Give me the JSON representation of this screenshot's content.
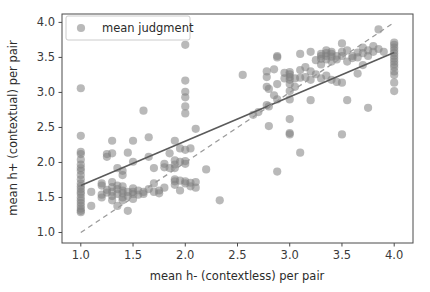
{
  "chart_data": {
    "type": "scatter",
    "title": "",
    "xlabel": "mean h- (contextless) per pair",
    "ylabel": "mean h+ (contextual) per pair",
    "xlim": [
      0.82,
      4.18
    ],
    "ylim": [
      0.85,
      4.12
    ],
    "xticks": [
      1.0,
      1.5,
      2.0,
      2.5,
      3.0,
      3.5,
      4.0
    ],
    "xticklabels": [
      "1.0",
      "1.5",
      "2.0",
      "2.5",
      "3.0",
      "3.5",
      "4.0"
    ],
    "yticks": [
      1.0,
      1.5,
      2.0,
      2.5,
      3.0,
      3.5,
      4.0
    ],
    "yticklabels": [
      "1.0",
      "1.5",
      "2.0",
      "2.5",
      "3.0",
      "3.5",
      "4.0"
    ],
    "grid": false,
    "legend": {
      "position": "upper left",
      "entries": [
        {
          "label": "mean judgment",
          "marker": "circle",
          "color": "#8c8c8c"
        }
      ]
    },
    "marker": {
      "color": "#7f7f7f",
      "opacity": 0.55,
      "radius": 4.1
    },
    "lines": [
      {
        "name": "regression-line",
        "style": "solid",
        "color": "#5a5a5a",
        "width": 1.6,
        "x": [
          1.0,
          4.0
        ],
        "y": [
          1.67,
          3.57
        ]
      },
      {
        "name": "identity-line",
        "style": "dashed",
        "color": "#9a9a9a",
        "width": 1.3,
        "x": [
          1.0,
          4.0
        ],
        "y": [
          1.0,
          4.0
        ]
      }
    ],
    "series": [
      {
        "name": "mean judgment",
        "points": [
          [
            1.0,
            3.06
          ],
          [
            1.0,
            2.38
          ],
          [
            1.0,
            2.15
          ],
          [
            1.0,
            2.12
          ],
          [
            1.0,
            2.04
          ],
          [
            1.0,
            1.97
          ],
          [
            1.0,
            1.92
          ],
          [
            1.0,
            1.88
          ],
          [
            1.0,
            1.82
          ],
          [
            1.0,
            1.76
          ],
          [
            1.0,
            1.7
          ],
          [
            1.0,
            1.66
          ],
          [
            1.0,
            1.62
          ],
          [
            1.0,
            1.58
          ],
          [
            1.0,
            1.55
          ],
          [
            1.0,
            1.5
          ],
          [
            1.0,
            1.46
          ],
          [
            1.0,
            1.42
          ],
          [
            1.0,
            1.38
          ],
          [
            1.0,
            1.34
          ],
          [
            1.0,
            1.31
          ],
          [
            1.0,
            1.29
          ],
          [
            1.1,
            1.58
          ],
          [
            1.1,
            1.38
          ],
          [
            1.2,
            1.7
          ],
          [
            1.2,
            1.67
          ],
          [
            1.2,
            1.54
          ],
          [
            1.2,
            1.5
          ],
          [
            1.25,
            2.12
          ],
          [
            1.25,
            2.08
          ],
          [
            1.25,
            1.61
          ],
          [
            1.25,
            1.57
          ],
          [
            1.3,
            2.31
          ],
          [
            1.3,
            2.13
          ],
          [
            1.3,
            1.72
          ],
          [
            1.3,
            1.65
          ],
          [
            1.3,
            1.58
          ],
          [
            1.3,
            1.52
          ],
          [
            1.3,
            1.46
          ],
          [
            1.35,
            1.92
          ],
          [
            1.35,
            1.67
          ],
          [
            1.35,
            1.62
          ],
          [
            1.35,
            1.55
          ],
          [
            1.35,
            1.38
          ],
          [
            1.4,
            1.88
          ],
          [
            1.4,
            1.82
          ],
          [
            1.4,
            1.66
          ],
          [
            1.4,
            1.6
          ],
          [
            1.4,
            1.56
          ],
          [
            1.4,
            1.5
          ],
          [
            1.4,
            1.46
          ],
          [
            1.45,
            2.14
          ],
          [
            1.45,
            1.58
          ],
          [
            1.45,
            1.52
          ],
          [
            1.45,
            1.31
          ],
          [
            1.5,
            2.31
          ],
          [
            1.5,
            2.01
          ],
          [
            1.5,
            1.63
          ],
          [
            1.5,
            1.58
          ],
          [
            1.5,
            1.55
          ],
          [
            1.5,
            1.48
          ],
          [
            1.55,
            1.6
          ],
          [
            1.55,
            1.54
          ],
          [
            1.6,
            2.74
          ],
          [
            1.6,
            1.58
          ],
          [
            1.6,
            1.55
          ],
          [
            1.65,
            2.36
          ],
          [
            1.65,
            2.08
          ],
          [
            1.65,
            1.62
          ],
          [
            1.7,
            1.92
          ],
          [
            1.7,
            1.7
          ],
          [
            1.7,
            1.58
          ],
          [
            1.75,
            1.6
          ],
          [
            1.75,
            1.56
          ],
          [
            1.8,
            1.98
          ],
          [
            1.8,
            1.93
          ],
          [
            1.8,
            1.64
          ],
          [
            1.85,
            2.13
          ],
          [
            1.85,
            1.92
          ],
          [
            1.9,
            2.31
          ],
          [
            1.9,
            2.03
          ],
          [
            1.9,
            1.97
          ],
          [
            1.9,
            1.92
          ],
          [
            1.9,
            1.76
          ],
          [
            1.9,
            1.73
          ],
          [
            1.9,
            1.68
          ],
          [
            1.95,
            2.2
          ],
          [
            1.95,
            2.01
          ],
          [
            1.95,
            1.74
          ],
          [
            1.95,
            1.6
          ],
          [
            2.0,
            3.68
          ],
          [
            2.0,
            3.17
          ],
          [
            2.0,
            3.01
          ],
          [
            2.0,
            2.93
          ],
          [
            2.0,
            2.8
          ],
          [
            2.0,
            2.7
          ],
          [
            2.0,
            2.18
          ],
          [
            2.0,
            2.02
          ],
          [
            2.0,
            1.98
          ],
          [
            2.0,
            1.73
          ],
          [
            2.0,
            1.7
          ],
          [
            2.05,
            2.2
          ],
          [
            2.05,
            1.71
          ],
          [
            2.05,
            1.66
          ],
          [
            2.1,
            2.48
          ],
          [
            2.1,
            1.72
          ],
          [
            2.1,
            1.64
          ],
          [
            2.2,
            1.9
          ],
          [
            2.33,
            1.46
          ],
          [
            2.55,
            3.25
          ],
          [
            2.65,
            2.68
          ],
          [
            2.7,
            2.72
          ],
          [
            2.78,
            3.3
          ],
          [
            2.78,
            3.22
          ],
          [
            2.78,
            3.08
          ],
          [
            2.78,
            2.82
          ],
          [
            2.8,
            3.05
          ],
          [
            2.8,
            2.8
          ],
          [
            2.8,
            2.52
          ],
          [
            2.85,
            3.33
          ],
          [
            2.85,
            2.96
          ],
          [
            2.88,
            3.52
          ],
          [
            2.88,
            3.5
          ],
          [
            2.88,
            3.12
          ],
          [
            2.88,
            2.9
          ],
          [
            2.88,
            1.87
          ],
          [
            2.95,
            3.28
          ],
          [
            2.95,
            3.2
          ],
          [
            3.0,
            3.29
          ],
          [
            3.0,
            3.26
          ],
          [
            3.0,
            3.22
          ],
          [
            3.0,
            3.18
          ],
          [
            3.0,
            3.12
          ],
          [
            3.0,
            3.02
          ],
          [
            3.0,
            2.9
          ],
          [
            3.0,
            2.62
          ],
          [
            3.0,
            2.42
          ],
          [
            3.0,
            2.4
          ],
          [
            3.05,
            3.2
          ],
          [
            3.05,
            3.08
          ],
          [
            3.1,
            3.55
          ],
          [
            3.1,
            3.32
          ],
          [
            3.1,
            3.21
          ],
          [
            3.1,
            2.14
          ],
          [
            3.15,
            3.36
          ],
          [
            3.15,
            3.22
          ],
          [
            3.2,
            3.58
          ],
          [
            3.2,
            3.3
          ],
          [
            3.2,
            3.18
          ],
          [
            3.2,
            2.89
          ],
          [
            3.25,
            3.46
          ],
          [
            3.25,
            3.26
          ],
          [
            3.3,
            3.55
          ],
          [
            3.3,
            3.52
          ],
          [
            3.3,
            3.48
          ],
          [
            3.3,
            3.4
          ],
          [
            3.3,
            3.2
          ],
          [
            3.35,
            3.6
          ],
          [
            3.35,
            3.56
          ],
          [
            3.35,
            3.52
          ],
          [
            3.35,
            3.47
          ],
          [
            3.35,
            3.24
          ],
          [
            3.4,
            3.58
          ],
          [
            3.4,
            3.55
          ],
          [
            3.4,
            3.51
          ],
          [
            3.4,
            3.44
          ],
          [
            3.4,
            3.18
          ],
          [
            3.45,
            3.52
          ],
          [
            3.45,
            3.47
          ],
          [
            3.45,
            3.15
          ],
          [
            3.5,
            3.7
          ],
          [
            3.5,
            3.58
          ],
          [
            3.5,
            3.52
          ],
          [
            3.5,
            3.14
          ],
          [
            3.5,
            2.4
          ],
          [
            3.55,
            3.6
          ],
          [
            3.55,
            3.44
          ],
          [
            3.55,
            2.89
          ],
          [
            3.6,
            3.52
          ],
          [
            3.6,
            3.49
          ],
          [
            3.65,
            3.57
          ],
          [
            3.65,
            3.5
          ],
          [
            3.65,
            3.27
          ],
          [
            3.7,
            3.64
          ],
          [
            3.7,
            3.56
          ],
          [
            3.7,
            3.39
          ],
          [
            3.75,
            3.6
          ],
          [
            3.75,
            3.52
          ],
          [
            3.75,
            2.78
          ],
          [
            3.8,
            3.66
          ],
          [
            3.8,
            3.58
          ],
          [
            3.85,
            3.9
          ],
          [
            3.85,
            3.62
          ],
          [
            3.9,
            3.58
          ],
          [
            4.0,
            3.71
          ],
          [
            4.0,
            3.68
          ],
          [
            4.0,
            3.64
          ],
          [
            4.0,
            3.6
          ],
          [
            4.0,
            3.56
          ],
          [
            4.0,
            3.52
          ],
          [
            4.0,
            3.48
          ],
          [
            4.0,
            3.44
          ],
          [
            4.0,
            3.4
          ],
          [
            4.0,
            3.36
          ],
          [
            4.0,
            3.3
          ],
          [
            4.0,
            3.25
          ],
          [
            4.0,
            3.14
          ],
          [
            4.0,
            3.02
          ]
        ]
      }
    ]
  },
  "axes_geometry": {
    "left_px": 62,
    "right_px": 413,
    "top_px": 14,
    "bottom_px": 243
  },
  "legend": {
    "label": "mean judgment"
  },
  "labels": {
    "xlabel": "mean h- (contextless) per pair",
    "ylabel": "mean h+ (contextual) per pair"
  }
}
